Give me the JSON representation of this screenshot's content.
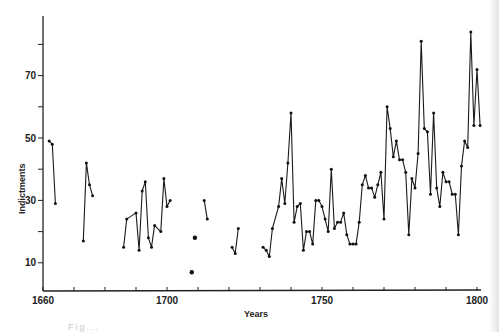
{
  "chart_data": {
    "type": "line",
    "title": "",
    "xlabel": "Years",
    "ylabel": "Indictments",
    "xlim": [
      1660,
      1800
    ],
    "ylim": [
      0,
      85
    ],
    "x_ticks": [
      1660,
      1670,
      1680,
      1690,
      1700,
      1710,
      1720,
      1730,
      1740,
      1750,
      1760,
      1770,
      1780,
      1790,
      1800
    ],
    "x_tick_labels": [
      "1660",
      "1700",
      "1750",
      "1800"
    ],
    "y_ticks": [
      10,
      20,
      30,
      40,
      50,
      60,
      70,
      80
    ],
    "y_tick_labels": [
      "10",
      "30",
      "50",
      "70"
    ],
    "grid": false,
    "legend": null,
    "series": [
      {
        "name": "Indictments",
        "segments": [
          [
            [
              1662,
              49
            ],
            [
              1663,
              48
            ],
            [
              1664,
              29
            ]
          ],
          [
            [
              1673,
              17
            ],
            [
              1674,
              42
            ],
            [
              1675,
              35
            ],
            [
              1676,
              31.5
            ]
          ],
          [
            [
              1686,
              15
            ],
            [
              1687,
              24
            ],
            [
              1690,
              26
            ],
            [
              1691,
              14
            ],
            [
              1692,
              33
            ],
            [
              1693,
              36
            ],
            [
              1694,
              18
            ],
            [
              1695,
              15
            ],
            [
              1696,
              22
            ],
            [
              1698,
              20
            ],
            [
              1699,
              37
            ],
            [
              1700,
              28
            ],
            [
              1701,
              30
            ]
          ],
          [
            [
              1708,
              7
            ]
          ],
          [
            [
              1709,
              18
            ]
          ],
          [
            [
              1712,
              30
            ],
            [
              1713,
              24
            ]
          ],
          [
            [
              1721,
              15
            ],
            [
              1722,
              13
            ],
            [
              1723,
              21
            ]
          ],
          [
            [
              1731,
              15
            ],
            [
              1732,
              14
            ],
            [
              1733,
              12
            ],
            [
              1734,
              21
            ],
            [
              1736,
              28
            ],
            [
              1737,
              37
            ],
            [
              1738,
              29
            ],
            [
              1739,
              42
            ],
            [
              1740,
              58
            ],
            [
              1741,
              23
            ],
            [
              1742,
              28
            ],
            [
              1743,
              29
            ],
            [
              1744,
              14
            ],
            [
              1745,
              20
            ],
            [
              1746,
              20
            ],
            [
              1747,
              16
            ],
            [
              1748,
              30
            ],
            [
              1749,
              30
            ],
            [
              1750,
              28
            ],
            [
              1751,
              24
            ],
            [
              1752,
              20
            ],
            [
              1753,
              40
            ],
            [
              1754,
              21
            ],
            [
              1755,
              23
            ],
            [
              1756,
              23
            ],
            [
              1757,
              26
            ],
            [
              1758,
              19
            ],
            [
              1759,
              16
            ],
            [
              1760,
              16
            ],
            [
              1761,
              16
            ],
            [
              1762,
              23
            ],
            [
              1763,
              35
            ],
            [
              1764,
              38
            ],
            [
              1765,
              34
            ],
            [
              1766,
              34
            ],
            [
              1767,
              31
            ],
            [
              1768,
              35
            ],
            [
              1769,
              39
            ],
            [
              1770,
              24
            ],
            [
              1771,
              60
            ],
            [
              1772,
              53
            ],
            [
              1773,
              44
            ],
            [
              1774,
              49
            ],
            [
              1775,
              43
            ],
            [
              1776,
              43
            ],
            [
              1777,
              39
            ],
            [
              1778,
              19
            ],
            [
              1779,
              37
            ],
            [
              1780,
              34
            ],
            [
              1781,
              45
            ],
            [
              1782,
              81
            ],
            [
              1783,
              53
            ],
            [
              1784,
              52
            ],
            [
              1785,
              32
            ],
            [
              1786,
              58
            ],
            [
              1787,
              34
            ],
            [
              1788,
              28
            ],
            [
              1789,
              39
            ],
            [
              1790,
              36
            ],
            [
              1791,
              36
            ],
            [
              1792,
              32
            ],
            [
              1793,
              32
            ],
            [
              1794,
              19
            ],
            [
              1795,
              41
            ],
            [
              1796,
              49
            ],
            [
              1797,
              47
            ],
            [
              1798,
              84
            ],
            [
              1799,
              54
            ],
            [
              1800,
              72
            ],
            [
              1801,
              54
            ]
          ]
        ]
      }
    ]
  },
  "caption": "Fig..."
}
